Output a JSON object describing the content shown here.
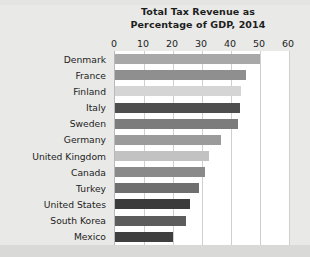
{
  "chart_data": {
    "type": "bar",
    "orientation": "horizontal",
    "title": "Total Tax Revenue as Percentage of GDP, 2014",
    "title_lines": [
      "Total Tax Revenue as",
      "Percentage of GDP, 2014"
    ],
    "xlabel": "",
    "ylabel": "",
    "xlim": [
      0,
      60
    ],
    "xticks": [
      0,
      10,
      20,
      30,
      40,
      50,
      60
    ],
    "xtick_labels": [
      "0",
      "10",
      "20",
      "30",
      "40",
      "50",
      "60"
    ],
    "grid": true,
    "legend": "none",
    "categories": [
      "Denmark",
      "France",
      "Finland",
      "Italy",
      "Sweden",
      "Germany",
      "United Kingdom",
      "Canada",
      "Turkey",
      "United States",
      "South Korea",
      "Mexico"
    ],
    "values": [
      50,
      45,
      43.5,
      43,
      42.5,
      36.5,
      32.5,
      31,
      29,
      26,
      24.5,
      20
    ],
    "bar_colors": [
      "#a8a8a8",
      "#8f8f8f",
      "#d5d5d5",
      "#4e4e4e",
      "#7c7c7c",
      "#9b9b9b",
      "#c2c2c2",
      "#8a8a8a",
      "#6f6f6f",
      "#3b3b3b",
      "#5c5c5c",
      "#3f3f3f"
    ],
    "plot_background": "#ffffff",
    "page_background": "#e9e9e7",
    "gridline_color": "#cfcfcd",
    "text_color": "#1d1d1d"
  }
}
